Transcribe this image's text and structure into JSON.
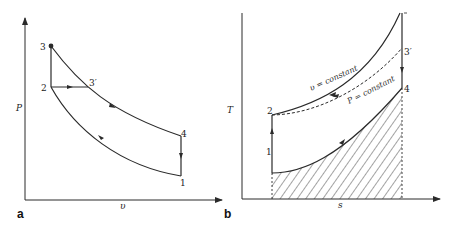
{
  "figure": {
    "panel_a": {
      "label": "a",
      "x_axis_label": "υ",
      "y_axis_label": "P",
      "points": {
        "p1": "1",
        "p2": "2",
        "p3": "3",
        "p3prime": "3′",
        "p4": "4"
      }
    },
    "panel_b": {
      "label": "b",
      "x_axis_label": "s",
      "y_axis_label": "T",
      "points": {
        "p1": "1",
        "p2": "2",
        "p3prime": "3′",
        "p4": "4"
      },
      "curve_labels": {
        "constant_volume": "υ = constant",
        "constant_pressure": "P = constant"
      }
    },
    "colors": {
      "line": "#2a2a2a",
      "background": "#ffffff"
    }
  }
}
